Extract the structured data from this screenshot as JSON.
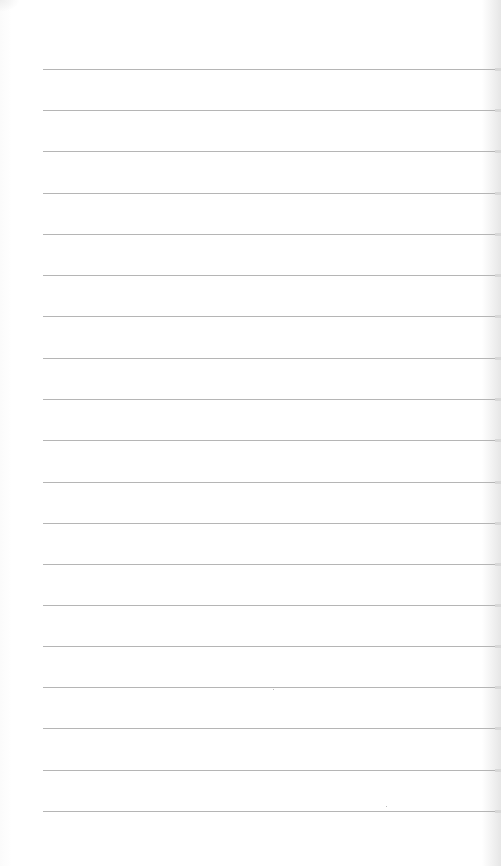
{
  "page": {
    "type": "lined-paper",
    "background": "#ffffff",
    "line_color": "#b5b5b5",
    "line_left": 43,
    "line_right": 497,
    "line_count": 19,
    "lines_y": [
      69,
      110,
      151,
      193,
      234,
      275,
      316,
      358,
      399,
      440,
      482,
      523,
      564,
      605,
      646,
      687,
      728,
      770,
      811
    ]
  }
}
